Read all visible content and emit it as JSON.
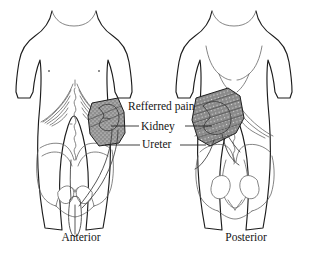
{
  "figure": {
    "type": "anatomical-illustration",
    "background_color": "#ffffff",
    "line_color": "#1d1d1d",
    "shade_color": "#8d8d8d"
  },
  "callouts": [
    {
      "id": "referred-pain",
      "label": "Refferred pain",
      "has_leaders": false
    },
    {
      "id": "kidney",
      "label": "Kidney",
      "has_leaders": true
    },
    {
      "id": "ureter",
      "label": "Ureter",
      "has_leaders": true
    }
  ],
  "labels": {
    "referred_pain": "Refferred pain",
    "kidney": "Kidney",
    "ureter": "Ureter"
  },
  "captions": {
    "left": "Anterior",
    "right": "Posterior"
  },
  "views": [
    {
      "id": "anterior",
      "caption": "Anterior",
      "shaded_region": "kidney referred pain, right flank, stippled gray",
      "visible_structures": [
        "torso outline",
        "arms",
        "ribcage",
        "costal margin",
        "vertebral midline",
        "pelvis",
        "bladder",
        "ureter",
        "kidney"
      ]
    },
    {
      "id": "posterior",
      "caption": "Posterior",
      "shaded_region": "kidney referred pain, left loin, hatched gray",
      "visible_structures": [
        "back outline",
        "arms",
        "scapular contours",
        "ribcage",
        "spine",
        "pelvis",
        "sacrum",
        "ureter",
        "kidney"
      ]
    }
  ]
}
